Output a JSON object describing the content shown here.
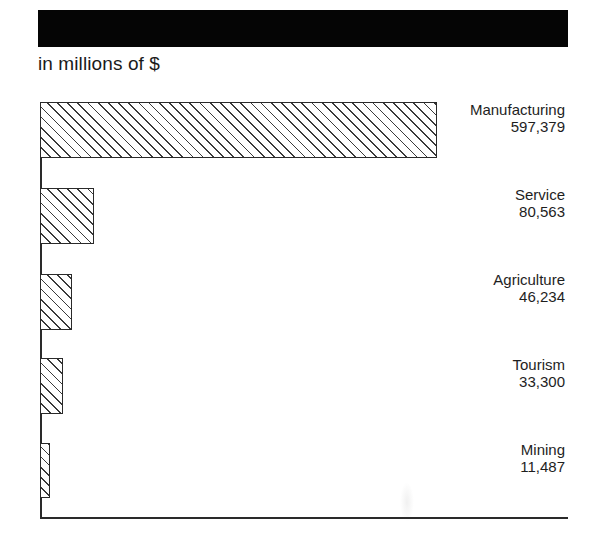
{
  "header": {
    "title": "",
    "title_bar_color": "#050505",
    "subtitle": "in millions of $"
  },
  "chart_data": {
    "type": "bar",
    "orientation": "horizontal",
    "title": "",
    "subtitle": "in millions of $",
    "xlabel": "",
    "ylabel": "",
    "categories": [
      "Manufacturing",
      "Service",
      "Agriculture",
      "Tourism",
      "Mining"
    ],
    "values": [
      597379,
      80563,
      46234,
      33300,
      11487
    ],
    "value_labels": [
      "597,379",
      "80,563",
      "46,234",
      "33,300",
      "11,487"
    ],
    "units": "millions of $",
    "xlim": [
      0,
      597379
    ],
    "grid": false,
    "legend": null,
    "bar_fill": "diagonal hatch",
    "bar_color": "#2a2a2a"
  },
  "bars": [
    {
      "name": "Manufacturing",
      "value": "597,379",
      "top": 102,
      "width": 397,
      "height": 56,
      "label_top": 101
    },
    {
      "name": "Service",
      "value": "80,563",
      "top": 188,
      "width": 54,
      "height": 56,
      "label_top": 186
    },
    {
      "name": "Agriculture",
      "value": "46,234",
      "top": 274,
      "width": 32,
      "height": 56,
      "label_top": 271
    },
    {
      "name": "Tourism",
      "value": "33,300",
      "top": 358,
      "width": 23,
      "height": 56,
      "label_top": 356
    },
    {
      "name": "Mining",
      "value": "11,487",
      "top": 443,
      "width": 10,
      "height": 55,
      "label_top": 441
    }
  ]
}
